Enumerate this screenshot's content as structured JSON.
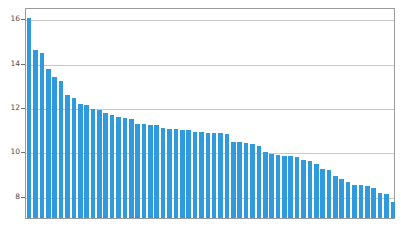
{
  "chart_data": {
    "type": "bar",
    "title": "",
    "subtitle": "",
    "xlabel": "",
    "ylabel": "",
    "ylim": [
      7.0,
      16.5
    ],
    "xlim": [
      0,
      58
    ],
    "grid": true,
    "grid_axis": "y",
    "legend": false,
    "legend_position": "none",
    "bar_color": "#2f9ade",
    "yticks": [
      8,
      10,
      12,
      14,
      16
    ],
    "ytick_labels": [
      "8",
      "10",
      "12",
      "14",
      "16"
    ],
    "xtick_labels": [],
    "categories": [
      "1",
      "2",
      "3",
      "4",
      "5",
      "6",
      "7",
      "8",
      "9",
      "10",
      "11",
      "12",
      "13",
      "14",
      "15",
      "16",
      "17",
      "18",
      "19",
      "20",
      "21",
      "22",
      "23",
      "24",
      "25",
      "26",
      "27",
      "28",
      "29",
      "30",
      "31",
      "32",
      "33",
      "34",
      "35",
      "36",
      "37",
      "38",
      "39",
      "40",
      "41",
      "42",
      "43",
      "44",
      "45",
      "46",
      "47",
      "48",
      "49",
      "50",
      "51",
      "52",
      "53",
      "54",
      "55",
      "56",
      "57",
      "58"
    ],
    "values": [
      16.0,
      14.55,
      14.42,
      13.7,
      13.35,
      13.15,
      12.55,
      12.4,
      12.15,
      12.1,
      11.9,
      11.85,
      11.75,
      11.62,
      11.55,
      11.5,
      11.45,
      11.25,
      11.25,
      11.2,
      11.18,
      11.05,
      11.0,
      11.0,
      10.98,
      10.95,
      10.88,
      10.87,
      10.85,
      10.85,
      10.85,
      10.78,
      10.4,
      10.4,
      10.38,
      10.35,
      10.25,
      9.95,
      9.9,
      9.82,
      9.8,
      9.78,
      9.75,
      9.62,
      9.55,
      9.45,
      9.22,
      9.15,
      8.9,
      8.75,
      8.6,
      8.5,
      8.5,
      8.45,
      8.35,
      8.12,
      8.1,
      7.72
    ]
  }
}
